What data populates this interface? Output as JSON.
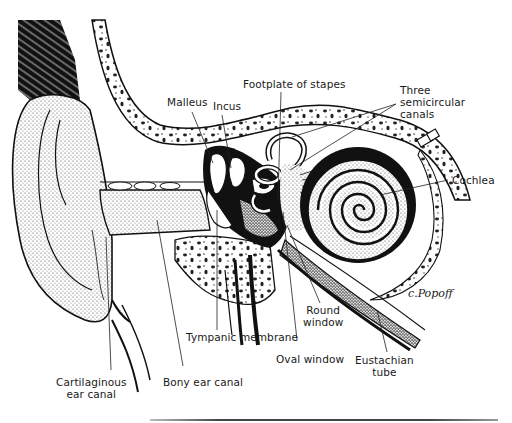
{
  "figure": {
    "signature": "c.Popoff",
    "labels": {
      "footplate_of_stapes": "Footplate of stapes",
      "malleus": "Malleus",
      "incus": "Incus",
      "three_semicircular_canals": [
        "Three",
        "semicircular",
        "canals"
      ],
      "cochlea": "Cochlea",
      "round_window": [
        "Round",
        "window"
      ],
      "tympanic_membrane": "Tympanic membrane",
      "oval_window": "Oval window",
      "eustachian_tube": [
        "Eustachian",
        "tube"
      ],
      "cartilaginous_ear_canal": [
        "Cartilaginous",
        "ear canal"
      ],
      "bony_ear_canal": "Bony ear canal"
    },
    "colors": {
      "ink": "#111111",
      "background": "#ffffff",
      "stipple": "#555555"
    }
  }
}
